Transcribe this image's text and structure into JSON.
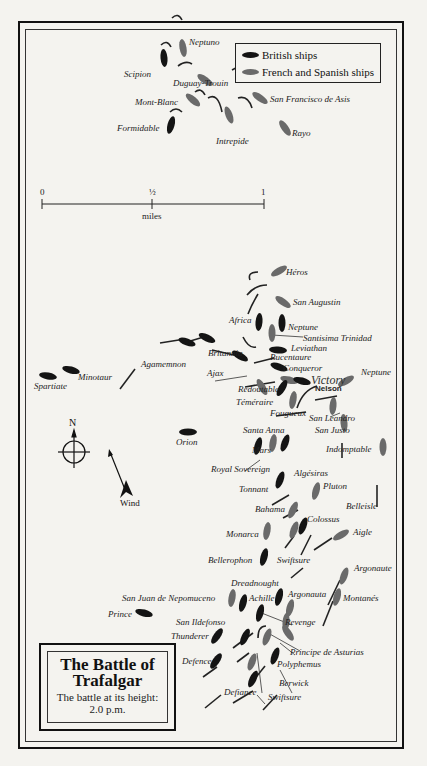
{
  "title": {
    "line1": "The Battle of",
    "line2": "Trafalgar",
    "subtitle": "The battle at its height:",
    "time": "2.0 p.m."
  },
  "legend": {
    "british": {
      "label": "British ships",
      "color": "#141414"
    },
    "franco_spanish": {
      "label": "French and Spanish ships",
      "color": "#6a6a6a"
    }
  },
  "scale": {
    "ticks": [
      "0",
      "½",
      "1"
    ],
    "unit": "miles"
  },
  "compass": {
    "north": "N"
  },
  "wind": {
    "label": "Wind"
  },
  "flagships": {
    "victory": "Victory",
    "nelson": "Nelson"
  },
  "ships": {
    "neptuno": "Neptuno",
    "scipion": "Scipion",
    "duguay_trouin": "Duguay-Trouin",
    "mont_blanc": "Mont-Blanc",
    "san_francisco_de_asis": "San Francisco de Asis",
    "formidable": "Formidable",
    "intrepide": "Intrepide",
    "rayo": "Rayo",
    "heros": "Héros",
    "san_augustin": "San Augustin",
    "africa": "Africa",
    "neptune_british": "Neptune",
    "santisima_trinidad": "Santisima Trinidad",
    "leviathan": "Leviathan",
    "agamemnon": "Agamemnon",
    "britannia": "Britannia",
    "bucentaure": "Bucentaure",
    "ajax": "Ajax",
    "conqueror": "Conqueror",
    "spartiate": "Spartiate",
    "minotaur": "Minotaur",
    "neptune_french": "Neptune",
    "redoutable": "Redoutable",
    "temeraire": "Téméraire",
    "fougueux": "Fougueux",
    "san_leandro": "San Leandro",
    "san_justo": "San Justo",
    "santa_anna": "Santa Anna",
    "orion": "Orion",
    "mars": "Mars",
    "indomptable": "Indomptable",
    "royal_sovereign": "Royal Sovereign",
    "algesiras": "Algésiras",
    "tonnant": "Tonnant",
    "pluton": "Pluton",
    "belleisle": "Belleisle",
    "bahama": "Bahama",
    "colossus": "Colossus",
    "monarca": "Monarca",
    "aigle": "Aigle",
    "swiftsure_french": "Swiftsure",
    "bellerophon": "Bellerophon",
    "argonaute": "Argonaute",
    "dreadnought": "Dreadnought",
    "san_juan": "San Juan de Nepomuceno",
    "achille": "Achille",
    "argonauta": "Argonauta",
    "montanes": "Montanés",
    "prince": "Prince",
    "san_ildefonso": "San Ildefonso",
    "revenge": "Revenge",
    "thunderer": "Thunderer",
    "principe": "Principe de Asturias",
    "defence": "Defence",
    "polyphemus": "Polyphemus",
    "berwick": "Berwick",
    "defiance": "Defiance",
    "swiftsure_british": "Swiftsure"
  }
}
